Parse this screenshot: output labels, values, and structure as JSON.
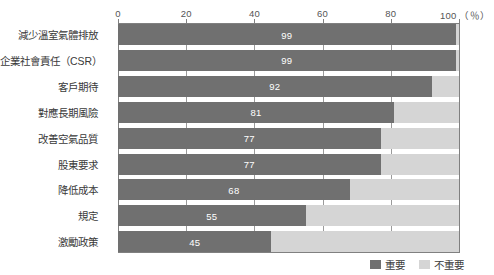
{
  "chart_data": {
    "type": "bar",
    "orientation": "horizontal",
    "stacked": true,
    "title": "",
    "xlabel": "(%)",
    "ylabel": "",
    "xlim": [
      0,
      100
    ],
    "xticks": [
      0,
      20,
      40,
      60,
      80,
      100
    ],
    "xtick_labels": [
      "0",
      "20",
      "40",
      "60",
      "80",
      "100"
    ],
    "unit_label": "（％）",
    "grid": true,
    "grid_axis": "x",
    "legend_position": "bottom-right",
    "categories": [
      "減少溫室氣體排放",
      "企業社會責任（CSR）",
      "客戶期待",
      "對應長期風險",
      "改善空氣品質",
      "股東要求",
      "降低成本",
      "規定",
      "激勵政策"
    ],
    "series": [
      {
        "name": "重要",
        "color": "#707070",
        "values": [
          99,
          99,
          92,
          81,
          77,
          77,
          68,
          55,
          45
        ]
      },
      {
        "name": "不重要",
        "color": "#d5d5d5",
        "values": [
          1,
          1,
          8,
          19,
          23,
          23,
          32,
          45,
          55
        ]
      }
    ],
    "value_labels": [
      "99",
      "99",
      "92",
      "81",
      "77",
      "77",
      "68",
      "55",
      "45"
    ],
    "value_label_color": "#ffffff"
  },
  "legend": {
    "items": [
      {
        "label": "重要",
        "color": "#707070"
      },
      {
        "label": "不重要",
        "color": "#d5d5d5"
      }
    ]
  },
  "axis": {
    "unit": "（％）"
  }
}
